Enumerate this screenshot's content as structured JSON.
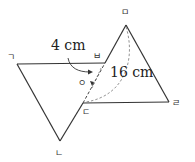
{
  "diagram": {
    "type": "geometry-folding",
    "colors": {
      "line": "#333333",
      "dashed": "#555555",
      "background": "#ffffff"
    },
    "vertices": {
      "giyeok": {
        "label": "ㄱ"
      },
      "nieun": {
        "label": "ㄴ"
      },
      "digeut": {
        "label": "ㄷ"
      },
      "rieul": {
        "label": "ㄹ"
      },
      "mieum": {
        "label": "ㅁ"
      },
      "bieup": {
        "label": "ㅂ"
      },
      "ieung": {
        "label": "ㅇ"
      }
    },
    "measurements": {
      "short": "4 cm",
      "long": "16 cm"
    }
  }
}
